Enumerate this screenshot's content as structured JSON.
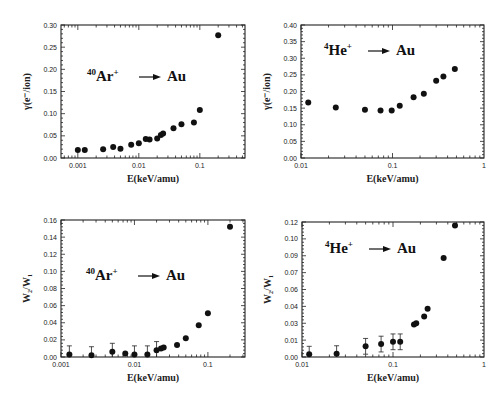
{
  "chart_data": [
    {
      "id": "ar-gamma",
      "type": "scatter",
      "title": "",
      "annotation": {
        "mass": "40",
        "ion": "Ar",
        "charge": "+",
        "target": "Au"
      },
      "xlabel": "E(keV/amu)",
      "ylabel": "γ(e⁻/ion)",
      "xscale": "log",
      "xlim": [
        0.00053,
        0.55
      ],
      "ylim": [
        0,
        0.3
      ],
      "xticks": [
        {
          "v": 0.001,
          "label": "0.001"
        },
        {
          "v": 0.01,
          "label": "0.01"
        },
        {
          "v": 0.1,
          "label": "0.1"
        }
      ],
      "yticks": [
        {
          "v": 0,
          "label": "0.00"
        },
        {
          "v": 0.05,
          "label": "0.05"
        },
        {
          "v": 0.1,
          "label": "0.10"
        },
        {
          "v": 0.15,
          "label": "0.15"
        },
        {
          "v": 0.2,
          "label": "0.20"
        },
        {
          "v": 0.25,
          "label": "0.25"
        },
        {
          "v": 0.3,
          "label": "0.30"
        }
      ],
      "points": [
        {
          "x": 0.001,
          "y": 0.018
        },
        {
          "x": 0.0013,
          "y": 0.018
        },
        {
          "x": 0.0026,
          "y": 0.02
        },
        {
          "x": 0.0038,
          "y": 0.025
        },
        {
          "x": 0.005,
          "y": 0.021
        },
        {
          "x": 0.0075,
          "y": 0.03
        },
        {
          "x": 0.01,
          "y": 0.033
        },
        {
          "x": 0.013,
          "y": 0.043
        },
        {
          "x": 0.015,
          "y": 0.042
        },
        {
          "x": 0.02,
          "y": 0.044
        },
        {
          "x": 0.023,
          "y": 0.052
        },
        {
          "x": 0.025,
          "y": 0.055
        },
        {
          "x": 0.037,
          "y": 0.067
        },
        {
          "x": 0.05,
          "y": 0.076
        },
        {
          "x": 0.08,
          "y": 0.08
        },
        {
          "x": 0.1,
          "y": 0.108
        },
        {
          "x": 0.2,
          "y": 0.277
        }
      ]
    },
    {
      "id": "he-gamma",
      "type": "scatter",
      "title": "",
      "annotation": {
        "mass": "4",
        "ion": "He",
        "charge": "+",
        "target": "Au"
      },
      "xlabel": "E(keV/amu)",
      "ylabel": "γ(e⁻/ion)",
      "xscale": "log",
      "xlim": [
        0.01,
        1
      ],
      "ylim": [
        0,
        0.4
      ],
      "xticks": [
        {
          "v": 0.01,
          "label": "0.01"
        },
        {
          "v": 0.1,
          "label": "0.1"
        },
        {
          "v": 1,
          "label": "1"
        }
      ],
      "yticks": [
        {
          "v": 0,
          "label": "0.00"
        },
        {
          "v": 0.05,
          "label": "0.05"
        },
        {
          "v": 0.1,
          "label": "0.10"
        },
        {
          "v": 0.15,
          "label": "0.15"
        },
        {
          "v": 0.2,
          "label": "0.20"
        },
        {
          "v": 0.25,
          "label": "0.25"
        },
        {
          "v": 0.3,
          "label": "0.30"
        },
        {
          "v": 0.35,
          "label": "0.35"
        },
        {
          "v": 0.4,
          "label": "0.40"
        }
      ],
      "points": [
        {
          "x": 0.012,
          "y": 0.167
        },
        {
          "x": 0.024,
          "y": 0.152
        },
        {
          "x": 0.05,
          "y": 0.145
        },
        {
          "x": 0.074,
          "y": 0.143
        },
        {
          "x": 0.098,
          "y": 0.143
        },
        {
          "x": 0.12,
          "y": 0.157
        },
        {
          "x": 0.17,
          "y": 0.183
        },
        {
          "x": 0.22,
          "y": 0.193
        },
        {
          "x": 0.3,
          "y": 0.232
        },
        {
          "x": 0.36,
          "y": 0.245
        },
        {
          "x": 0.48,
          "y": 0.268
        }
      ]
    },
    {
      "id": "ar-ratio",
      "type": "scatter",
      "title": "",
      "annotation": {
        "mass": "40",
        "ion": "Ar",
        "charge": "+",
        "target": "Au"
      },
      "xlabel": "E(keV/amu)",
      "ylabel": "W₂/W₁",
      "xscale": "log",
      "xlim": [
        0.001,
        0.32
      ],
      "ylim": [
        0,
        0.16
      ],
      "xticks": [
        {
          "v": 0.001,
          "label": "0.001"
        },
        {
          "v": 0.01,
          "label": "0.01"
        },
        {
          "v": 0.1,
          "label": "0.1"
        }
      ],
      "yticks": [
        {
          "v": 0,
          "label": "0.00"
        },
        {
          "v": 0.02,
          "label": "0.02"
        },
        {
          "v": 0.04,
          "label": "0.04"
        },
        {
          "v": 0.06,
          "label": "0.06"
        },
        {
          "v": 0.08,
          "label": "0.08"
        },
        {
          "v": 0.1,
          "label": "0.10"
        },
        {
          "v": 0.12,
          "label": "0.12"
        },
        {
          "v": 0.14,
          "label": "0.14"
        },
        {
          "v": 0.16,
          "label": "0.16"
        }
      ],
      "points": [
        {
          "x": 0.0013,
          "y": 0.003,
          "err": 0.01
        },
        {
          "x": 0.0026,
          "y": 0.002,
          "err": 0.01
        },
        {
          "x": 0.005,
          "y": 0.006,
          "err": 0.01
        },
        {
          "x": 0.0075,
          "y": 0.004
        },
        {
          "x": 0.01,
          "y": 0.003,
          "err": 0.01
        },
        {
          "x": 0.015,
          "y": 0.003,
          "err": 0.01
        },
        {
          "x": 0.02,
          "y": 0.008,
          "err": 0.01
        },
        {
          "x": 0.023,
          "y": 0.01
        },
        {
          "x": 0.025,
          "y": 0.011
        },
        {
          "x": 0.038,
          "y": 0.014
        },
        {
          "x": 0.05,
          "y": 0.022
        },
        {
          "x": 0.075,
          "y": 0.037
        },
        {
          "x": 0.1,
          "y": 0.051
        },
        {
          "x": 0.2,
          "y": 0.152
        }
      ]
    },
    {
      "id": "he-ratio",
      "type": "scatter",
      "title": "",
      "annotation": {
        "mass": "4",
        "ion": "He",
        "charge": "+",
        "target": "Au"
      },
      "xlabel": "E(keV/amu)",
      "ylabel": "W₂/W₁",
      "xscale": "log",
      "xlim": [
        0.01,
        1
      ],
      "ylim": [
        0,
        0.12
      ],
      "xticks": [
        {
          "v": 0.01,
          "label": "0.01"
        },
        {
          "v": 0.1,
          "label": "0.1"
        },
        {
          "v": 1,
          "label": "1"
        }
      ],
      "yticks": [
        {
          "v": 0,
          "label": "0.00"
        },
        {
          "v": 0.015,
          "label": "0.01"
        },
        {
          "v": 0.03,
          "label": "0.03"
        },
        {
          "v": 0.045,
          "label": "0.04"
        },
        {
          "v": 0.06,
          "label": "0.06"
        },
        {
          "v": 0.075,
          "label": "0.07"
        },
        {
          "v": 0.09,
          "label": "0.09"
        },
        {
          "v": 0.105,
          "label": "0.10"
        },
        {
          "v": 0.12,
          "label": "0.12"
        }
      ],
      "points": [
        {
          "x": 0.012,
          "y": 0.0025,
          "err": 0.007
        },
        {
          "x": 0.024,
          "y": 0.003,
          "err": 0.007
        },
        {
          "x": 0.05,
          "y": 0.0095,
          "err": 0.007
        },
        {
          "x": 0.074,
          "y": 0.0115,
          "err": 0.007
        },
        {
          "x": 0.1,
          "y": 0.0135,
          "err": 0.007
        },
        {
          "x": 0.12,
          "y": 0.0135,
          "err": 0.007
        },
        {
          "x": 0.17,
          "y": 0.029
        },
        {
          "x": 0.18,
          "y": 0.03
        },
        {
          "x": 0.22,
          "y": 0.036
        },
        {
          "x": 0.24,
          "y": 0.043
        },
        {
          "x": 0.36,
          "y": 0.088
        },
        {
          "x": 0.48,
          "y": 0.117
        }
      ]
    }
  ]
}
